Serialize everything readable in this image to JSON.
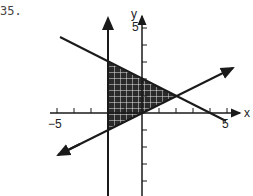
{
  "problem_number": "35.",
  "graph": {
    "x_axis_label": "x",
    "y_axis_label": "y",
    "x_tick_labels": {
      "min": "−5",
      "max": "5"
    },
    "y_tick_label_top": "5",
    "region": "shaded triangle bounded by x = -2, upper decreasing line, and lower increasing line",
    "lines": [
      {
        "name": "vertical",
        "equation": "x = -2"
      },
      {
        "name": "decreasing",
        "equation": "y = -x/2 + 2"
      },
      {
        "name": "increasing",
        "equation": "y = x/2"
      }
    ],
    "colors": {
      "ink": "#1a1a1a",
      "shade": "#2a2a2a",
      "grid": "#ffffff"
    }
  }
}
